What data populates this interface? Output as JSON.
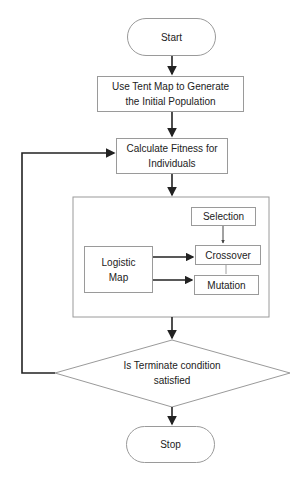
{
  "diagram": {
    "type": "flowchart",
    "nodes": {
      "start": "Start",
      "tent_map": "Use Tent Map to Generate the Initial Population",
      "fitness": "Calculate Fitness for Individuals",
      "selection": "Selection",
      "logistic_map": "Logistic Map",
      "crossover": "Crossover",
      "mutation": "Mutation",
      "decision": "Is Terminate condition satisfied",
      "stop": "Stop"
    },
    "edges": [
      {
        "from": "start",
        "to": "tent_map"
      },
      {
        "from": "tent_map",
        "to": "fitness"
      },
      {
        "from": "fitness",
        "to": "operators_group"
      },
      {
        "from": "selection",
        "to": "crossover"
      },
      {
        "from": "crossover",
        "to": "mutation"
      },
      {
        "from": "logistic_map",
        "to": "crossover"
      },
      {
        "from": "logistic_map",
        "to": "mutation"
      },
      {
        "from": "operators_group",
        "to": "decision"
      },
      {
        "from": "decision",
        "to": "fitness",
        "label": "loop back"
      },
      {
        "from": "decision",
        "to": "stop"
      }
    ],
    "colors": {
      "line": "#222222",
      "border": "#9a9a9a",
      "text": "#222222"
    }
  }
}
